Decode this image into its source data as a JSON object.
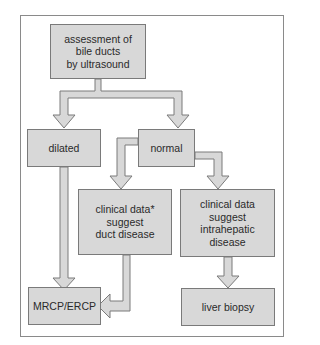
{
  "diagram": {
    "type": "flowchart",
    "nodes": {
      "start": "assessment of\nbile ducts\nby ultrasound",
      "dilated": "dilated",
      "normal": "normal",
      "duct_disease": "clinical data*\nsuggest\nduct disease",
      "intrahepatic": "clinical data\nsuggest\nintrahepatic\ndisease",
      "mrcp": "MRCP/ERCP",
      "biopsy": "liver biopsy"
    },
    "edges": [
      [
        "start",
        "dilated"
      ],
      [
        "start",
        "normal"
      ],
      [
        "normal",
        "duct_disease"
      ],
      [
        "normal",
        "intrahepatic"
      ],
      [
        "dilated",
        "mrcp"
      ],
      [
        "duct_disease",
        "mrcp"
      ],
      [
        "intrahepatic",
        "biopsy"
      ]
    ],
    "colors": {
      "box_fill": "#d8d8d8",
      "box_border": "#7a7a7a",
      "arrow_fill": "#d8d8d8"
    }
  }
}
